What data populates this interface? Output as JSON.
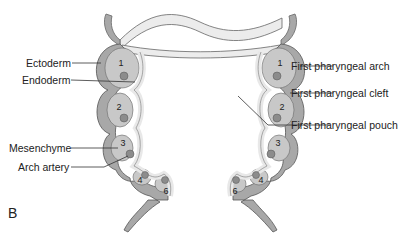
{
  "figure": {
    "panel_label": "B"
  },
  "labels_left": [
    {
      "id": "ectoderm",
      "text": "Ectoderm"
    },
    {
      "id": "endoderm",
      "text": "Endoderm"
    },
    {
      "id": "mesenchyme",
      "text": "Mesenchyme"
    },
    {
      "id": "arch-artery",
      "text": "Arch artery"
    }
  ],
  "labels_right": [
    {
      "id": "first-arch",
      "text": "First pharyngeal arch"
    },
    {
      "id": "first-cleft",
      "text": "First pharyngeal cleft"
    },
    {
      "id": "first-pouch",
      "text": "First pharyngeal pouch"
    }
  ],
  "arch_numbers": {
    "left": [
      "1",
      "2",
      "3",
      "4",
      "6"
    ],
    "right": [
      "1",
      "2",
      "3",
      "4",
      "6"
    ]
  },
  "colors": {
    "ectoderm": "#a8a8a8",
    "endoderm": "#e6e6e6",
    "mesenchyme": "#c8c8c8",
    "artery": "#8c8c8c",
    "outline": "#555555",
    "leader": "#333333"
  }
}
